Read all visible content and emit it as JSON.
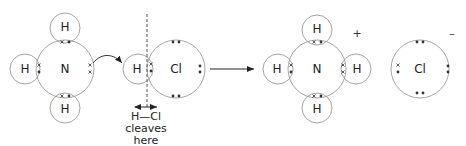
{
  "diagram": {
    "type": "dot-and-cross reaction diagram",
    "left_molecule": {
      "name": "ammonia",
      "center_atom": "N",
      "outer_atoms": [
        "H",
        "H",
        "H"
      ]
    },
    "acid_molecule": {
      "atoms": [
        "H",
        "Cl"
      ]
    },
    "annotation": {
      "line1": "H—Cl",
      "line2": "cleaves",
      "line3": "here"
    },
    "product_cation": {
      "center_atom": "N",
      "outer_atoms": [
        "H",
        "H",
        "H",
        "H"
      ],
      "charge": "+"
    },
    "product_anion": {
      "atom": "Cl",
      "charge": "–"
    },
    "labels": {
      "N": "N",
      "H": "H",
      "Cl": "Cl"
    },
    "colors": {
      "circle_stroke": "#9a9a9a",
      "text": "#222222",
      "electron": "#333333"
    }
  }
}
